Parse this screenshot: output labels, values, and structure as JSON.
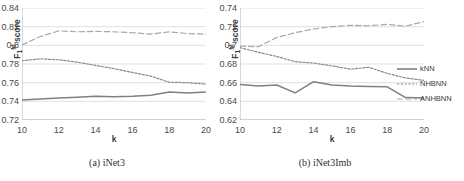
{
  "figure": {
    "panels": [
      {
        "id": "a",
        "caption": "(a) iNet3",
        "xlabel": "k",
        "ylabel_html": "F1M score",
        "ylabel_base": "F",
        "ylabel_sub": "1",
        "ylabel_sup": "M",
        "ylabel_rest": " score"
      },
      {
        "id": "b",
        "caption": "(b) iNet3Imb",
        "xlabel": "k",
        "ylabel_html": "F1M score",
        "ylabel_base": "F",
        "ylabel_sub": "1",
        "ylabel_sup": "M",
        "ylabel_rest": " score"
      }
    ]
  },
  "legend": {
    "position": "right",
    "items": [
      {
        "label": "kNN",
        "style": "solid",
        "color": "#808080"
      },
      {
        "label": "NHBNN",
        "style": "dotted",
        "color": "#8a8a8a"
      },
      {
        "label": "ANHBNN",
        "style": "dashed",
        "color": "#a8a8a8"
      }
    ]
  },
  "chart_data": [
    {
      "type": "line",
      "title": "(a) iNet3",
      "xlabel": "k",
      "ylabel": "F_1^M score",
      "x": [
        10,
        11,
        12,
        13,
        14,
        15,
        16,
        17,
        18,
        19,
        20
      ],
      "xlim": [
        10,
        20
      ],
      "xticks": [
        10,
        12,
        14,
        16,
        18,
        20
      ],
      "ylim": [
        0.72,
        0.84
      ],
      "yticks": [
        0.72,
        0.74,
        0.76,
        0.78,
        0.8,
        0.82,
        0.84
      ],
      "ytick_labels": [
        "0.72",
        "0.74",
        "0.76",
        "0.78",
        "0.8",
        "0.82",
        "0.84"
      ],
      "grid": true,
      "series": [
        {
          "name": "kNN",
          "style": "solid",
          "color": "#808080",
          "values": [
            0.7415,
            0.7425,
            0.7435,
            0.7443,
            0.7455,
            0.745,
            0.7455,
            0.7465,
            0.75,
            0.749,
            0.75
          ]
        },
        {
          "name": "NHBNN",
          "style": "dotted",
          "color": "#8a8a8a",
          "values": [
            0.7835,
            0.7855,
            0.7845,
            0.782,
            0.7785,
            0.775,
            0.771,
            0.767,
            0.7605,
            0.76,
            0.7585
          ]
        },
        {
          "name": "ANHBNN",
          "style": "dashed",
          "color": "#a8a8a8",
          "values": [
            0.8005,
            0.8095,
            0.8155,
            0.8145,
            0.815,
            0.8145,
            0.8135,
            0.812,
            0.8145,
            0.8125,
            0.812
          ]
        }
      ]
    },
    {
      "type": "line",
      "title": "(b) iNet3Imb",
      "xlabel": "k",
      "ylabel": "F_1^M score",
      "x": [
        10,
        11,
        12,
        13,
        14,
        15,
        16,
        17,
        18,
        19,
        20
      ],
      "xlim": [
        10,
        20
      ],
      "xticks": [
        10,
        12,
        14,
        16,
        18,
        20
      ],
      "ylim": [
        0.62,
        0.74
      ],
      "yticks": [
        0.62,
        0.64,
        0.66,
        0.68,
        0.7,
        0.72,
        0.74
      ],
      "ytick_labels": [
        "0.62",
        "0.64",
        "0.66",
        "0.68",
        "0.7",
        "0.72",
        "0.74"
      ],
      "grid": true,
      "series": [
        {
          "name": "kNN",
          "style": "solid",
          "color": "#808080",
          "values": [
            0.658,
            0.6565,
            0.6575,
            0.649,
            0.661,
            0.6575,
            0.6565,
            0.656,
            0.6555,
            0.644,
            0.6435
          ]
        },
        {
          "name": "NHBNN",
          "style": "dotted",
          "color": "#8a8a8a",
          "values": [
            0.6975,
            0.6925,
            0.688,
            0.6825,
            0.681,
            0.678,
            0.6745,
            0.6765,
            0.67,
            0.665,
            0.6625
          ]
        },
        {
          "name": "ANHBNN",
          "style": "dashed",
          "color": "#a8a8a8",
          "values": [
            0.699,
            0.6985,
            0.7085,
            0.7135,
            0.7175,
            0.72,
            0.7215,
            0.721,
            0.7225,
            0.7205,
            0.7255
          ]
        }
      ]
    }
  ]
}
